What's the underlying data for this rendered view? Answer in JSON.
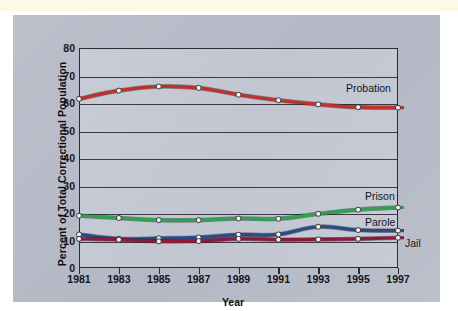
{
  "panel": {
    "bg_color": "#b9bdc9",
    "plot_bg_color": "#c5cad4",
    "top_strip_color": "#fbfae2"
  },
  "chart_data": {
    "type": "line",
    "title": "",
    "xlabel": "Year",
    "ylabel": "Percent of Total Correctional Population",
    "x": [
      1981,
      1983,
      1985,
      1987,
      1989,
      1991,
      1993,
      1995,
      1997
    ],
    "categories": [
      "1981",
      "1983",
      "1985",
      "1987",
      "1989",
      "1991",
      "1993",
      "1995",
      "1997"
    ],
    "xlim": [
      1981,
      1997
    ],
    "ylim": [
      0,
      80
    ],
    "yticks": [
      0,
      10,
      20,
      30,
      40,
      50,
      60,
      70,
      80
    ],
    "ytick_labels": [
      "0",
      "10",
      "20",
      "30",
      "40",
      "50",
      "60",
      "70",
      "80"
    ],
    "grid": true,
    "grid_axis": "y",
    "legend_position": "right-inline-annotations",
    "markers": "open-circle",
    "series": [
      {
        "name": "Probation",
        "color": "#c2302c",
        "values": [
          61.5,
          64.5,
          66.0,
          65.5,
          63.0,
          61.0,
          59.5,
          58.5,
          58.3
        ]
      },
      {
        "name": "Prison",
        "color": "#2ea24c",
        "values": [
          19.0,
          18.2,
          17.4,
          17.4,
          18.0,
          17.9,
          19.7,
          21.2,
          22.0
        ]
      },
      {
        "name": "Parole",
        "color": "#2d4a86",
        "values": [
          12.2,
          10.6,
          10.8,
          11.1,
          12.1,
          12.2,
          15.0,
          13.8,
          13.6
        ]
      },
      {
        "name": "Jail",
        "color": "#8d1a3a",
        "values": [
          10.6,
          10.3,
          9.7,
          9.8,
          10.6,
          10.3,
          10.4,
          10.6,
          11.0
        ]
      }
    ],
    "annotations": [
      {
        "text": "Probation",
        "series": "Probation"
      },
      {
        "text": "Prison",
        "series": "Prison"
      },
      {
        "text": "Parole",
        "series": "Parole"
      },
      {
        "text": "Jail",
        "series": "Jail"
      }
    ]
  }
}
